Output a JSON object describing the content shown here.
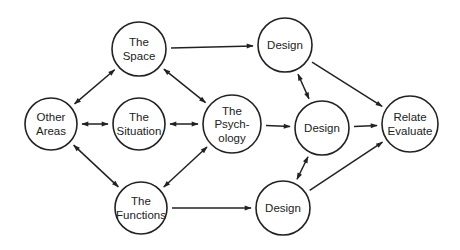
{
  "diagram": {
    "nodes": [
      {
        "id": "space",
        "lines": [
          "The",
          "Space"
        ],
        "x": 139,
        "y": 49,
        "r": 27
      },
      {
        "id": "design_top",
        "lines": [
          "Design"
        ],
        "x": 285,
        "y": 45,
        "r": 27
      },
      {
        "id": "other",
        "lines": [
          "Other",
          "Areas"
        ],
        "x": 51,
        "y": 124,
        "r": 26
      },
      {
        "id": "situation",
        "lines": [
          "The",
          "Situation"
        ],
        "x": 139,
        "y": 124,
        "r": 26
      },
      {
        "id": "psychology",
        "lines": [
          "The",
          "Psych-",
          "ology"
        ],
        "x": 232,
        "y": 124,
        "r": 29
      },
      {
        "id": "design_mid",
        "lines": [
          "Design"
        ],
        "x": 322,
        "y": 128,
        "r": 27
      },
      {
        "id": "relate",
        "lines": [
          "Relate",
          "Evaluate"
        ],
        "x": 410,
        "y": 124,
        "r": 28
      },
      {
        "id": "functions",
        "lines": [
          "The",
          "Functions"
        ],
        "x": 141,
        "y": 208,
        "r": 26
      },
      {
        "id": "design_bottom",
        "lines": [
          "Design"
        ],
        "x": 283,
        "y": 208,
        "r": 27
      }
    ],
    "edges": [
      {
        "from": "space",
        "to": "design_top",
        "dir": "forward"
      },
      {
        "from": "space",
        "to": "other",
        "dir": "both"
      },
      {
        "from": "space",
        "to": "psychology",
        "dir": "both"
      },
      {
        "from": "other",
        "to": "situation",
        "dir": "both"
      },
      {
        "from": "situation",
        "to": "psychology",
        "dir": "both"
      },
      {
        "from": "other",
        "to": "functions",
        "dir": "both"
      },
      {
        "from": "psychology",
        "to": "functions",
        "dir": "both"
      },
      {
        "from": "psychology",
        "to": "design_mid",
        "dir": "forward"
      },
      {
        "from": "functions",
        "to": "design_bottom",
        "dir": "forward"
      },
      {
        "from": "design_top",
        "to": "design_mid",
        "dir": "both"
      },
      {
        "from": "design_bottom",
        "to": "design_mid",
        "dir": "both"
      },
      {
        "from": "design_top",
        "to": "relate",
        "dir": "forward"
      },
      {
        "from": "design_mid",
        "to": "relate",
        "dir": "forward"
      },
      {
        "from": "design_bottom",
        "to": "relate",
        "dir": "forward"
      }
    ]
  }
}
